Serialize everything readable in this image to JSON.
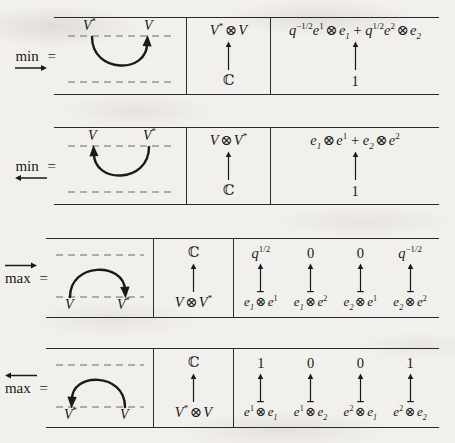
{
  "figure": {
    "kind": "duality-maps-table",
    "rows": [
      {
        "id": "min-right",
        "operator": "min",
        "operator_arrow": "right",
        "operator_arrow_position": "below",
        "equals": "=",
        "diagram": {
          "shape": "cup",
          "left_label": "V*",
          "right_label": "V",
          "arrow_at": "right",
          "labels_on": "top"
        },
        "space": {
          "top": "V* ⊗ V",
          "arrow": "up",
          "bottom": "ℂ"
        },
        "formula": {
          "top": "q^{-1/2} e^1 ⊗ e_1 + q^{1/2} e^2 ⊗ e_2",
          "arrow": "up",
          "bottom": "1"
        }
      },
      {
        "id": "min-left",
        "operator": "min",
        "operator_arrow": "left",
        "operator_arrow_position": "below",
        "equals": "=",
        "diagram": {
          "shape": "cup",
          "left_label": "V",
          "right_label": "V*",
          "arrow_at": "left",
          "labels_on": "top"
        },
        "space": {
          "top": "V ⊗ V*",
          "arrow": "up",
          "bottom": "ℂ"
        },
        "formula": {
          "top": "e_1 ⊗ e^1 + e_2 ⊗ e^2",
          "arrow": "up",
          "bottom": "1"
        }
      },
      {
        "id": "max-right",
        "operator": "max",
        "operator_arrow": "right",
        "operator_arrow_position": "above",
        "equals": "=",
        "diagram": {
          "shape": "cap",
          "left_label": "V",
          "right_label": "V*",
          "arrow_at": "right",
          "labels_on": "bottom"
        },
        "space": {
          "top": "ℂ",
          "arrow": "up",
          "bottom": "V ⊗ V*"
        },
        "maps": [
          {
            "source": "e_1 ⊗ e^1",
            "value": "q^{1/2}"
          },
          {
            "source": "e_1 ⊗ e^2",
            "value": "0"
          },
          {
            "source": "e_2 ⊗ e^1",
            "value": "0"
          },
          {
            "source": "e_2 ⊗ e^2",
            "value": "q^{-1/2}"
          }
        ]
      },
      {
        "id": "max-left",
        "operator": "max",
        "operator_arrow": "left",
        "operator_arrow_position": "above",
        "equals": "=",
        "diagram": {
          "shape": "cap",
          "left_label": "V*",
          "right_label": "V",
          "arrow_at": "left",
          "labels_on": "bottom"
        },
        "space": {
          "top": "ℂ",
          "arrow": "up",
          "bottom": "V* ⊗ V"
        },
        "maps": [
          {
            "source": "e^1 ⊗ e_1",
            "value": "1"
          },
          {
            "source": "e^1 ⊗ e_2",
            "value": "0"
          },
          {
            "source": "e^2 ⊗ e_1",
            "value": "0"
          },
          {
            "source": "e^2 ⊗ e_2",
            "value": "1"
          }
        ]
      }
    ]
  },
  "colors": {
    "ink": "#1a1a1a",
    "rule": "#2a2a2a",
    "dashed": "#6b6b6b",
    "paper": "#f2f0ec"
  }
}
